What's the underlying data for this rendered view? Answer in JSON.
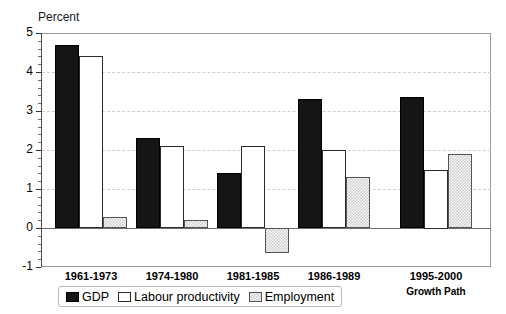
{
  "chart_data": {
    "type": "bar",
    "title": "",
    "subtitle": "",
    "xlabel": "",
    "ylabel": "Percent",
    "ylim": [
      -1,
      5
    ],
    "ytick_labels": [
      "5",
      "4",
      "3",
      "2",
      "1",
      "0",
      "-1"
    ],
    "ytick_values": [
      5,
      4,
      3,
      2,
      1,
      0,
      -1
    ],
    "grid": true,
    "grid_axis": "y",
    "legend_position": "bottom",
    "categories": [
      "1961-1973",
      "1974-1980",
      "1981-1985",
      "1986-1989",
      "1995-2000"
    ],
    "category_sublabels": [
      "",
      "",
      "",
      "",
      "Growth Path"
    ],
    "series": [
      {
        "name": "GDP",
        "color": "#151515",
        "values": [
          4.7,
          2.3,
          1.4,
          3.3,
          3.35
        ]
      },
      {
        "name": "Labour productivity",
        "color": "#ffffff",
        "values": [
          4.4,
          2.1,
          2.1,
          2.0,
          1.5
        ]
      },
      {
        "name": "Employment",
        "color": "#d2d2d2",
        "values": [
          0.27,
          0.2,
          -0.65,
          1.3,
          1.9
        ]
      }
    ],
    "legend": [
      "GDP",
      "Labour productivity",
      "Employment"
    ],
    "annotations": []
  },
  "axis": {
    "y_title": "Percent"
  },
  "legend": {
    "items": [
      {
        "label": "GDP",
        "swatch": "black-square-swatch"
      },
      {
        "label": "Labour productivity",
        "swatch": "white-square-swatch"
      },
      {
        "label": "Employment",
        "swatch": "hatched-square-swatch"
      }
    ]
  }
}
